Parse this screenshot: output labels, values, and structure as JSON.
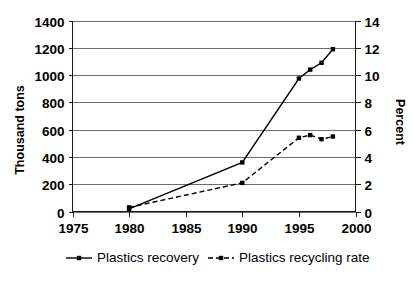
{
  "chart_data": {
    "type": "line",
    "title": "",
    "xlabel": "",
    "ylabel": "Thousand tons",
    "y2label": "Percent",
    "xlim": [
      1975,
      2000
    ],
    "ylim": [
      0,
      1400
    ],
    "y2lim": [
      0,
      14
    ],
    "grid": true,
    "legend_position": "bottom",
    "x_ticks": [
      "1975",
      "1980",
      "1985",
      "1990",
      "1995",
      "2000"
    ],
    "y_ticks": [
      "0",
      "200",
      "400",
      "600",
      "800",
      "1000",
      "1200",
      "1400"
    ],
    "y2_ticks": [
      "0",
      "2",
      "4",
      "6",
      "8",
      "10",
      "12",
      "14"
    ],
    "series": [
      {
        "name": "Plastics recovery",
        "axis": "left",
        "units": "Thousand tons",
        "line_style": "solid",
        "marker": "square",
        "x": [
          1980,
          1990,
          1995,
          1996,
          1997,
          1998
        ],
        "values": [
          20,
          360,
          975,
          1040,
          1090,
          1190
        ]
      },
      {
        "name": "Plastics recycling rate",
        "axis": "right",
        "units": "Percent",
        "line_style": "dashed",
        "marker": "square",
        "x": [
          1980,
          1990,
          1995,
          1996,
          1997,
          1998
        ],
        "values": [
          0.3,
          2.1,
          5.4,
          5.6,
          5.3,
          5.5
        ]
      }
    ]
  },
  "legend": {
    "items": [
      {
        "label": "Plastics recovery",
        "style": "solid"
      },
      {
        "label": "Plastics recycling rate",
        "style": "dashed"
      }
    ]
  }
}
